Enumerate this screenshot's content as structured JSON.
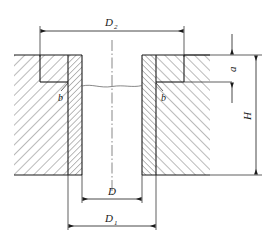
{
  "drawing": {
    "type": "engineering-cross-section",
    "description": "Sectional view of a cylindrical bushing seated in a counterbored plate",
    "colors": {
      "line": "#1a1a1a",
      "hatch": "#3a3a3a",
      "background": "#ffffff",
      "thin_line": "#555555"
    },
    "dimensions": [
      {
        "id": "d2",
        "label": "D",
        "subscript": "2",
        "position": "top",
        "orientation": "horizontal",
        "measures": "counterbore diameter"
      },
      {
        "id": "d",
        "label": "D",
        "subscript": "",
        "position": "bottom-inner",
        "orientation": "horizontal",
        "measures": "bushing bore diameter"
      },
      {
        "id": "d1",
        "label": "D",
        "subscript": "1",
        "position": "bottom-outer",
        "orientation": "horizontal",
        "measures": "bushing outer diameter"
      },
      {
        "id": "a",
        "label": "a",
        "subscript": "",
        "position": "right-upper",
        "orientation": "vertical",
        "measures": "counterbore depth"
      },
      {
        "id": "h",
        "label": "H",
        "subscript": "",
        "position": "right-lower",
        "orientation": "vertical",
        "measures": "plate thickness"
      }
    ],
    "leaders": [
      {
        "id": "b-left",
        "label": "b",
        "position": "left-inner-corner",
        "measures": "corner relief"
      },
      {
        "id": "b-right",
        "label": "b",
        "position": "right-inner-corner",
        "measures": "corner relief"
      }
    ]
  }
}
